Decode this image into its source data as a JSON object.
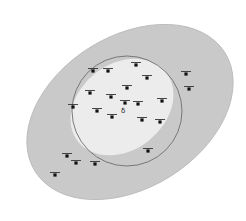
{
  "diagram": {
    "colors": {
      "background": "#ffffff",
      "outer_ellipse_fill": "#c9c9c9",
      "outer_ellipse_stroke": "#b8b8b8",
      "inner_ellipse_fill": "#ececec",
      "circle_stroke": "#6e6e6e",
      "marker": "#111111"
    },
    "outer_ellipse": {
      "cx": 130,
      "cy": 112,
      "rx": 112,
      "ry": 76,
      "rotate": -32
    },
    "inner_ellipse": {
      "cx": 122,
      "cy": 107,
      "rx": 56,
      "ry": 43,
      "rotate": -38
    },
    "circle": {
      "cx": 127,
      "cy": 111,
      "r": 55
    },
    "special_glyph": {
      "x": 121,
      "y": 113,
      "symbol": "δ"
    },
    "markers": [
      {
        "x": 136,
        "y": 65,
        "label": ""
      },
      {
        "x": 93,
        "y": 71,
        "label": ""
      },
      {
        "x": 108,
        "y": 71,
        "label": ""
      },
      {
        "x": 147,
        "y": 78,
        "label": ""
      },
      {
        "x": 186,
        "y": 74,
        "label": ""
      },
      {
        "x": 189,
        "y": 89,
        "label": ""
      },
      {
        "x": 90,
        "y": 93,
        "label": ""
      },
      {
        "x": 127,
        "y": 88,
        "label": ""
      },
      {
        "x": 111,
        "y": 97,
        "label": ""
      },
      {
        "x": 125,
        "y": 103,
        "label": ""
      },
      {
        "x": 138,
        "y": 104,
        "label": ""
      },
      {
        "x": 162,
        "y": 101,
        "label": ""
      },
      {
        "x": 73,
        "y": 107,
        "label": ""
      },
      {
        "x": 97,
        "y": 111,
        "label": ""
      },
      {
        "x": 112,
        "y": 117,
        "label": ""
      },
      {
        "x": 142,
        "y": 120,
        "label": ""
      },
      {
        "x": 160,
        "y": 122,
        "label": ""
      },
      {
        "x": 148,
        "y": 151,
        "label": ""
      },
      {
        "x": 67,
        "y": 156,
        "label": ""
      },
      {
        "x": 76,
        "y": 163,
        "label": ""
      },
      {
        "x": 95,
        "y": 164,
        "label": ""
      },
      {
        "x": 55,
        "y": 175,
        "label": ""
      }
    ]
  }
}
